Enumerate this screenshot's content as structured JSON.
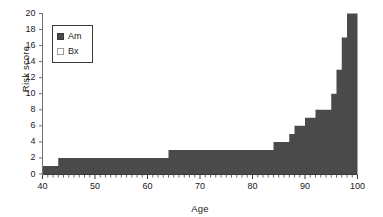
{
  "chart_data": {
    "type": "area",
    "title": "",
    "xlabel": "Age",
    "ylabel": "Risk score",
    "xlim": [
      40,
      100
    ],
    "ylim": [
      0,
      20
    ],
    "xticks": [
      40,
      50,
      60,
      70,
      80,
      90,
      100
    ],
    "yticks": [
      0,
      2,
      4,
      6,
      8,
      10,
      12,
      14,
      16,
      18,
      20
    ],
    "xtick_labels": [
      "40",
      "50",
      "60",
      "70",
      "80",
      "90",
      "100"
    ],
    "ytick_labels": [
      "0",
      "2",
      "4",
      "6",
      "8",
      "10",
      "12",
      "14",
      "16",
      "18",
      "20"
    ],
    "minor_xtick_interval": 1,
    "grid": false,
    "legend_position": "upper-left",
    "legend": [
      {
        "name": "Am",
        "marker": "filled-square",
        "color": "#4a4a4a"
      },
      {
        "name": "Bx",
        "marker": "hollow-square",
        "color": "#ffffff"
      }
    ],
    "series": [
      {
        "name": "Am",
        "color": "#4a4a4a",
        "step": "post",
        "x": [
          40,
          41,
          42,
          43,
          44,
          45,
          46,
          47,
          48,
          49,
          50,
          51,
          52,
          53,
          54,
          55,
          56,
          57,
          58,
          59,
          60,
          61,
          62,
          63,
          64,
          65,
          66,
          67,
          68,
          69,
          70,
          71,
          72,
          73,
          74,
          75,
          76,
          77,
          78,
          79,
          80,
          81,
          82,
          83,
          84,
          85,
          86,
          87,
          88,
          89,
          90,
          91,
          92,
          93,
          94,
          95,
          96,
          97,
          98,
          99,
          100
        ],
        "values": [
          1,
          1,
          1,
          2,
          2,
          2,
          2,
          2,
          2,
          2,
          2,
          2,
          2,
          2,
          2,
          2,
          2,
          2,
          2,
          2,
          2,
          2,
          2,
          2,
          3,
          3,
          3,
          3,
          3,
          3,
          3,
          3,
          3,
          3,
          3,
          3,
          3,
          3,
          3,
          3,
          3,
          3,
          3,
          3,
          4,
          4,
          4,
          5,
          6,
          6,
          7,
          7,
          8,
          8,
          8,
          10,
          13,
          17,
          20,
          20,
          20
        ]
      },
      {
        "name": "Bx",
        "color": "#ffffff",
        "step": "post",
        "x": [
          40,
          100
        ],
        "values": [
          0,
          0
        ]
      }
    ]
  },
  "axes": {
    "ylabel": "Risk score",
    "xlabel": "Age"
  }
}
